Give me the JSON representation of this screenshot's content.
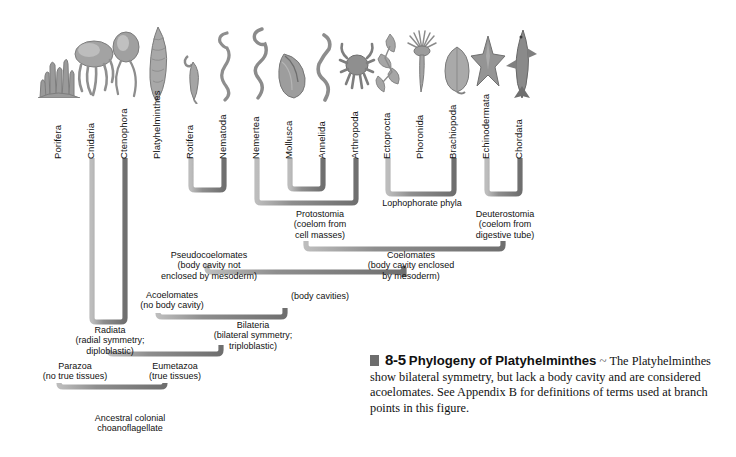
{
  "figure": {
    "title": "Phylogeny of Platyhelminthes",
    "number": "8-5",
    "tilde": "~",
    "caption_body": "The Platyhelminthes show bilateral symmetry, but lack a body cavity and are considered acoelomates. See Appendix B for definitions of terms used at branch points in this figure.",
    "colors": {
      "branch": "#8d8d8d",
      "branch_shade": "#6f6f6f",
      "text": "#111111",
      "caption_mark": "#6d6d6d",
      "background": "#ffffff"
    }
  },
  "taxa": [
    {
      "id": "porifera",
      "label": "Porifera",
      "x": 59,
      "icon": "sponge-icon"
    },
    {
      "id": "cnidaria",
      "label": "Cnidaria",
      "x": 92,
      "icon": "jellyfish-icon"
    },
    {
      "id": "ctenophora",
      "label": "Ctenophora",
      "x": 125,
      "icon": "comb-jelly-icon"
    },
    {
      "id": "platyhelminthes",
      "label": "Platyhelminthes",
      "x": 158,
      "icon": "flatworm-icon"
    },
    {
      "id": "rotifera",
      "label": "Rotifera",
      "x": 191,
      "icon": "rotifer-icon"
    },
    {
      "id": "nematoda",
      "label": "Nematoda",
      "x": 224,
      "icon": "roundworm-icon"
    },
    {
      "id": "nemertea",
      "label": "Nemertea",
      "x": 257,
      "icon": "ribbon-worm-icon"
    },
    {
      "id": "mollusca",
      "label": "Mollusca",
      "x": 290,
      "icon": "mussel-icon"
    },
    {
      "id": "annelida",
      "label": "Annelida",
      "x": 323,
      "icon": "earthworm-icon"
    },
    {
      "id": "arthropoda",
      "label": "Arthropoda",
      "x": 356,
      "icon": "crab-icon"
    },
    {
      "id": "ectoprocta",
      "label": "Ectoprocta",
      "x": 388,
      "icon": "bryozoan-icon"
    },
    {
      "id": "phoronida",
      "label": "Phoronida",
      "x": 421,
      "icon": "phoronid-icon"
    },
    {
      "id": "brachiopoda",
      "label": "Brachiopoda",
      "x": 454,
      "icon": "brachiopod-icon"
    },
    {
      "id": "echinodermata",
      "label": "Echinodermata",
      "x": 487,
      "icon": "sea-star-icon"
    },
    {
      "id": "chordata",
      "label": "Chordata",
      "x": 520,
      "icon": "shark-icon"
    }
  ],
  "nodes": [
    {
      "id": "parazoa",
      "line1": "Parazoa",
      "line2": "(no true tissues)",
      "line3": "",
      "x": 75,
      "y": 366
    },
    {
      "id": "radiata",
      "line1": "Radiata",
      "line2": "(radial symmetry;",
      "line3": "diploblastic)",
      "x": 110,
      "y": 330
    },
    {
      "id": "eumetazoa",
      "line1": "Eumetazoa",
      "line2": "(true tissues)",
      "line3": "",
      "x": 175,
      "y": 366
    },
    {
      "id": "acoelomates",
      "line1": "Acoelomates",
      "line2": "(no body cavity)",
      "line3": "",
      "x": 172,
      "y": 295
    },
    {
      "id": "pseudocoelomates",
      "line1": "Pseudocoelomates",
      "line2": "(body cavity not",
      "line3": "enclosed by mesoderm)",
      "x": 208,
      "y": 255
    },
    {
      "id": "bilateria",
      "line1": "Bilateria",
      "line2": "(bilateral symmetry;",
      "line3": "triploblastic)",
      "x": 252,
      "y": 325
    },
    {
      "id": "body-cavities",
      "line1": "(body cavities)",
      "line2": "",
      "line3": "",
      "x": 320,
      "y": 296
    },
    {
      "id": "protostomia",
      "line1": "Protostomia",
      "line2": "(coelom from",
      "line3": "cell masses)",
      "x": 320,
      "y": 214
    },
    {
      "id": "lophophorate",
      "line1": "Lophophorate phyla",
      "line2": "",
      "line3": "",
      "x": 421,
      "y": 203
    },
    {
      "id": "deuterostomia",
      "line1": "Deuterostomia",
      "line2": "(coelom from",
      "line3": "digestive tube)",
      "x": 504,
      "y": 214
    },
    {
      "id": "coelomates",
      "line1": "Coelomates",
      "line2": "(body cavity enclosed",
      "line3": "by mesoderm)",
      "x": 410,
      "y": 255
    },
    {
      "id": "ancestor",
      "line1": "Ancestral colonial",
      "line2": "choanoflagellate",
      "line3": "",
      "x": 130,
      "y": 418
    }
  ]
}
